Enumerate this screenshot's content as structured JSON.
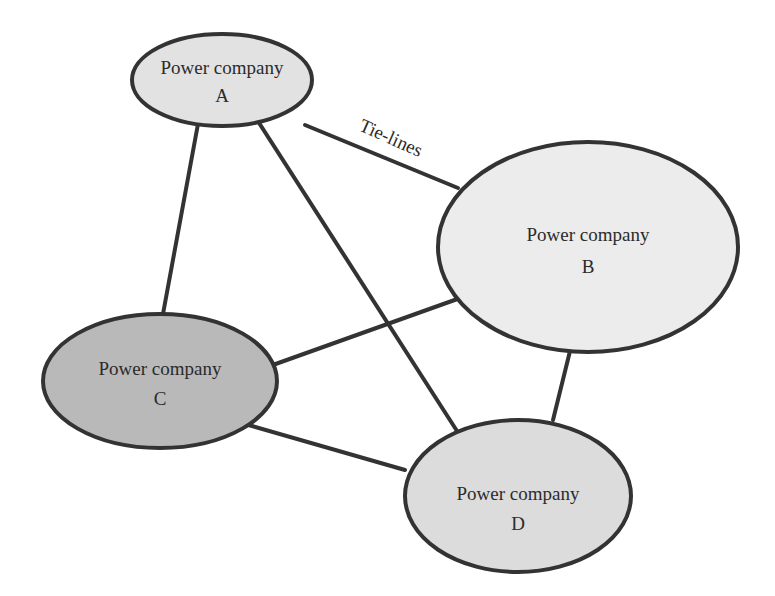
{
  "diagram": {
    "type": "network",
    "edge_label": "Tie-lines",
    "nodes": [
      {
        "id": "A",
        "line1": "Power company",
        "line2": "A",
        "fill": "#e2e2e2",
        "cx": 222,
        "cy": 80,
        "rx": 90,
        "ry": 46
      },
      {
        "id": "B",
        "line1": "Power company",
        "line2": "B",
        "fill": "#ececec",
        "cx": 588,
        "cy": 247,
        "rx": 150,
        "ry": 105
      },
      {
        "id": "C",
        "line1": "Power company",
        "line2": "C",
        "fill": "#b9b9b9",
        "cx": 160,
        "cy": 381,
        "rx": 117,
        "ry": 67
      },
      {
        "id": "D",
        "line1": "Power company",
        "line2": "D",
        "fill": "#dcdcdc",
        "cx": 518,
        "cy": 496,
        "rx": 113,
        "ry": 76
      }
    ],
    "edges": [
      {
        "from": "A",
        "to": "B",
        "x1": 305,
        "y1": 125,
        "x2": 458,
        "y2": 188
      },
      {
        "from": "A",
        "to": "C",
        "x1": 200,
        "y1": 113,
        "x2": 163,
        "y2": 314
      },
      {
        "from": "A",
        "to": "D",
        "x1": 254,
        "y1": 115,
        "x2": 457,
        "y2": 431
      },
      {
        "from": "B",
        "to": "C",
        "x1": 463,
        "y1": 297,
        "x2": 256,
        "y2": 371
      },
      {
        "from": "B",
        "to": "D",
        "x1": 572,
        "y1": 343,
        "x2": 553,
        "y2": 420
      },
      {
        "from": "C",
        "to": "D",
        "x1": 238,
        "y1": 422,
        "x2": 405,
        "y2": 470
      }
    ]
  }
}
